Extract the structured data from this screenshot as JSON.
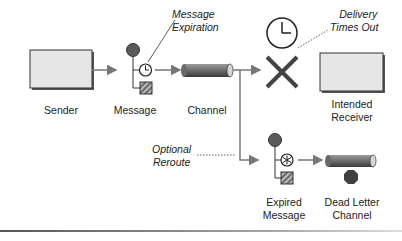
{
  "diagram": {
    "type": "message-expiration-flow",
    "nodes": {
      "sender": {
        "label": "Sender"
      },
      "message": {
        "label": "Message"
      },
      "channel": {
        "label": "Channel"
      },
      "receiver": {
        "label_line1": "Intended",
        "label_line2": "Receiver"
      },
      "expired_message": {
        "label_line1": "Expired",
        "label_line2": "Message"
      },
      "dead_letter_channel": {
        "label_line1": "Dead Letter",
        "label_line2": "Channel"
      }
    },
    "annotations": {
      "message_expiration": {
        "line1": "Message",
        "line2": "Expiration"
      },
      "delivery_times_out": {
        "line1": "Delivery",
        "line2": "Times Out"
      },
      "optional_reroute": {
        "line1": "Optional",
        "line2": "Reroute"
      }
    },
    "colors": {
      "box_fill": "#e6e6e6",
      "box_stroke": "#333333",
      "circle_fill": "#5a5a5a",
      "channel_fill": "#6a6a6a",
      "arrow": "#777777",
      "cross": "#444444"
    }
  }
}
